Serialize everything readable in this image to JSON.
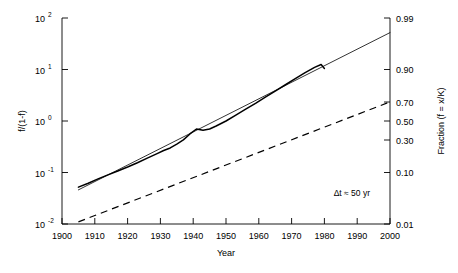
{
  "chart_data": {
    "type": "line",
    "title": "",
    "xlabel": "Year",
    "ylabel_left": "f/(1-f)",
    "ylabel_right": "Fraction (f = x/K)",
    "xlim": [
      1900,
      2000
    ],
    "xticks": [
      1900,
      1910,
      1920,
      1930,
      1940,
      1950,
      1960,
      1970,
      1980,
      1990,
      2000
    ],
    "xtick_labels": [
      "1900",
      "1910",
      "1920",
      "1930",
      "1940",
      "1950",
      "1960",
      "1970",
      "1980",
      "1990",
      "2000"
    ],
    "yscale": "log",
    "ylim_left": [
      0.01,
      100
    ],
    "left_ticks": [
      0.01,
      0.1,
      1,
      10,
      100
    ],
    "left_tick_labels": [
      "10-2",
      "10-1",
      "100",
      "101",
      "102"
    ],
    "left_tick_bases": [
      "10",
      "10",
      "10",
      "10",
      "10"
    ],
    "left_tick_exponents": [
      "-2",
      "-1",
      "0",
      "1",
      "2"
    ],
    "right_ticks_fraction": [
      0.01,
      0.1,
      0.3,
      0.5,
      0.7,
      0.9,
      0.99
    ],
    "right_tick_labels": [
      "0.01",
      "0.10",
      "0.30",
      "0.50",
      "0.70",
      "0.90",
      "0.99"
    ],
    "grid": false,
    "legend": "none",
    "annotations": [
      {
        "text": "Δt ≈ 50 yr",
        "x": 1975,
        "y": 0.055
      }
    ],
    "series": [
      {
        "name": "logistic-fit-line",
        "style": "thin-solid",
        "x": [
          1905,
          2000
        ],
        "values": [
          0.046,
          52.0
        ]
      },
      {
        "name": "data-curve",
        "style": "thick-solid",
        "x": [
          1905,
          1908,
          1911,
          1914,
          1917,
          1920,
          1923,
          1926,
          1929,
          1931,
          1933,
          1935,
          1937,
          1939,
          1941,
          1943,
          1945,
          1947,
          1950,
          1953,
          1956,
          1959,
          1962,
          1965,
          1968,
          1971,
          1974,
          1977,
          1979,
          1980
        ],
        "values": [
          0.052,
          0.062,
          0.075,
          0.09,
          0.107,
          0.128,
          0.155,
          0.19,
          0.233,
          0.268,
          0.3,
          0.355,
          0.43,
          0.56,
          0.7,
          0.66,
          0.7,
          0.8,
          1.0,
          1.3,
          1.7,
          2.2,
          2.9,
          3.8,
          5.0,
          6.6,
          8.6,
          11.0,
          12.5,
          10.5
        ]
      },
      {
        "name": "slow-reference-line",
        "style": "dashed",
        "x": [
          1905,
          2000
        ],
        "values": [
          0.011,
          2.35
        ]
      }
    ]
  },
  "axes": {
    "x_title": "Year",
    "y_left_title": "f/(1-f)",
    "y_right_title": "Fraction (f = x/K)"
  },
  "annotation": {
    "delta_t": "Δt ≈ 50 yr"
  },
  "colors": {
    "axis": "#000000",
    "data": "#000000",
    "background": "#ffffff"
  }
}
